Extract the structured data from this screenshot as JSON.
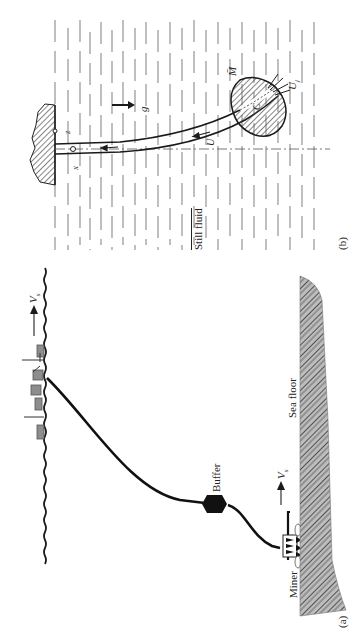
{
  "figure": {
    "panel_a": {
      "label": "(a)",
      "sea_floor_label": "Sea floor",
      "buffer_label": "Buffer",
      "miner_label": "Miner",
      "ship_velocity_label": "V",
      "ship_velocity_sub": "s",
      "miner_velocity_label": "V",
      "miner_velocity_sub": "s"
    },
    "panel_b": {
      "label": "(b)",
      "still_fluid_label": "Still fluid",
      "gravity_label": "g",
      "momentum_label": "M̄",
      "jet_velocity_label": "U",
      "jet_velocity_sub": "j",
      "flow_velocity_label": "U",
      "centroid_label": "C",
      "x_axis_label": "x",
      "z_axis_label": "z"
    }
  },
  "colors": {
    "ink": "#1a1a1a",
    "hatch": "#555555",
    "dash": "#8a8a8a",
    "background": "#ffffff"
  }
}
